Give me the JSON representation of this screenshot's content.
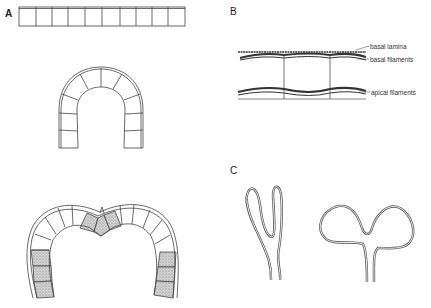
{
  "panels": {
    "A": {
      "label": "A"
    },
    "B": {
      "label": "B",
      "annotations": [
        "basal lamina",
        "basal filaments",
        "apical filaments"
      ]
    },
    "C": {
      "label": "C"
    }
  },
  "colors": {
    "stroke": "#444444",
    "shade": "#bdbdbd",
    "background": "#ffffff"
  }
}
